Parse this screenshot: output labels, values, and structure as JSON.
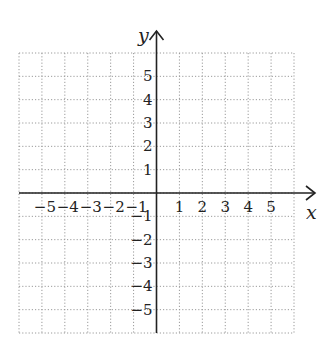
{
  "diagram": {
    "type": "coordinate-plane",
    "x_axis_label": "x",
    "y_axis_label": "y",
    "x_range": [
      -6,
      6
    ],
    "y_range": [
      -6,
      6
    ],
    "grid": "dotted",
    "x_tick_labels": [
      "-5",
      "-4",
      "-3",
      "-2",
      "-1",
      "1",
      "2",
      "3",
      "4",
      "5"
    ],
    "y_tick_labels": [
      "5",
      "4",
      "3",
      "2",
      "1",
      "-1",
      "-2",
      "-3",
      "-4",
      "-5"
    ],
    "colors": {
      "axis": "#222222",
      "grid": "#999999"
    }
  }
}
